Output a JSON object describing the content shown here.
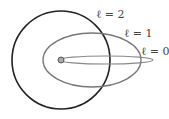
{
  "diagram": {
    "title": "",
    "orbits": [
      {
        "label": "ℓ = 2",
        "shape": "circle",
        "color": "#222222"
      },
      {
        "label": "ℓ = 1",
        "shape": "ellipse",
        "color": "#777777"
      },
      {
        "label": "ℓ = 0",
        "shape": "thin-ellipse",
        "color": "#888888"
      }
    ],
    "nucleus": {
      "color": "#888888"
    }
  }
}
